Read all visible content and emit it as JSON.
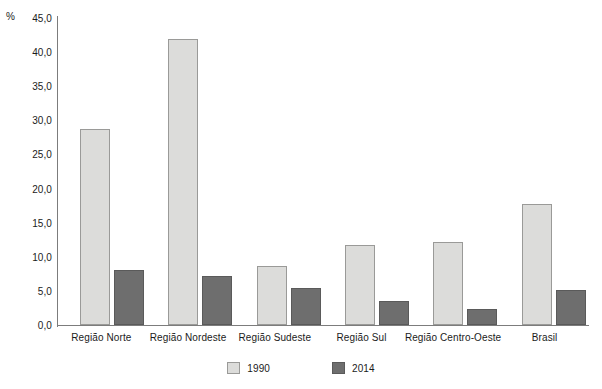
{
  "chart_data": {
    "type": "bar",
    "title": "",
    "subtitle": "",
    "xlabel": "",
    "ylabel": "%",
    "ylim": [
      0,
      45
    ],
    "ytick_step": 5,
    "ytick_labels": [
      "45,0",
      "40,0",
      "35,0",
      "30,0",
      "25,0",
      "20,0",
      "15,0",
      "10,0",
      "5,0",
      "0,0"
    ],
    "ytick_values": [
      45,
      40,
      35,
      30,
      25,
      20,
      15,
      10,
      5,
      0
    ],
    "grid": false,
    "legend_position": "bottom",
    "categories": [
      "Região Norte",
      "Região Nordeste",
      "Região Sudeste",
      "Região Sul",
      "Região Centro-Oeste",
      "Brasil"
    ],
    "series": [
      {
        "name": "1990",
        "color": "#dcdcda",
        "values": [
          28.7,
          41.9,
          8.6,
          11.7,
          12.1,
          17.8
        ]
      },
      {
        "name": "2014",
        "color": "#6e6e6e",
        "values": [
          8.1,
          7.2,
          5.4,
          3.5,
          2.3,
          5.2
        ]
      }
    ]
  },
  "axis": {
    "unit_label": "%"
  }
}
